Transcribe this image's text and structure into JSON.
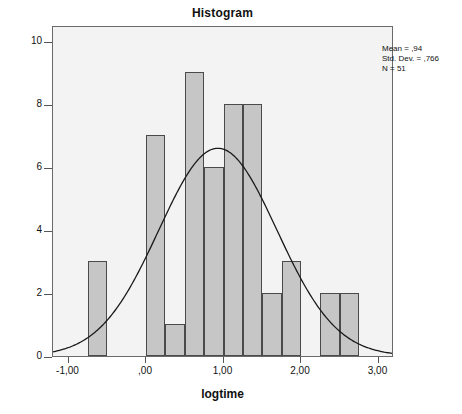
{
  "chart_data": {
    "type": "bar",
    "title": "Histogram",
    "xlabel": "logtime",
    "ylabel": "Frequency",
    "xlim": [
      -1.2,
      3.2
    ],
    "ylim": [
      0,
      10.5
    ],
    "grid": false,
    "legend_position": "none",
    "bin_width": 0.25,
    "x_tick_labels": [
      "-1,00",
      ",00",
      "1,00",
      "2,00",
      "3,00"
    ],
    "x_tick_values": [
      -1.0,
      0.0,
      1.0,
      2.0,
      3.0
    ],
    "y_tick_labels": [
      "0",
      "2",
      "4",
      "6",
      "8",
      "10"
    ],
    "y_tick_values": [
      0,
      2,
      4,
      6,
      8,
      10
    ],
    "bins": [
      {
        "start": -0.75,
        "end": -0.5,
        "value": 3
      },
      {
        "start": 0.0,
        "end": 0.25,
        "value": 7
      },
      {
        "start": 0.25,
        "end": 0.5,
        "value": 1
      },
      {
        "start": 0.5,
        "end": 0.75,
        "value": 9
      },
      {
        "start": 0.75,
        "end": 1.0,
        "value": 6
      },
      {
        "start": 1.0,
        "end": 1.25,
        "value": 8
      },
      {
        "start": 1.25,
        "end": 1.5,
        "value": 8
      },
      {
        "start": 1.5,
        "end": 1.75,
        "value": 2
      },
      {
        "start": 1.75,
        "end": 2.0,
        "value": 3
      },
      {
        "start": 2.25,
        "end": 2.5,
        "value": 2
      },
      {
        "start": 2.5,
        "end": 2.75,
        "value": 2
      }
    ],
    "categories": [
      "-0,75",
      "0,00",
      "0,25",
      "0,50",
      "0,75",
      "1,00",
      "1,25",
      "1,50",
      "1,75",
      "2,25",
      "2,50"
    ],
    "values": [
      3,
      7,
      1,
      9,
      6,
      8,
      8,
      2,
      3,
      2,
      2
    ],
    "normal_curve": {
      "label": "Normal distribution overlay",
      "mean": 0.94,
      "std_dev": 0.766,
      "n": 51,
      "peak_height": 6.63
    },
    "annotations": {
      "mean": "Mean = ,94",
      "std_dev": "Std. Dev. = ,766",
      "n": "N = 51"
    },
    "colors": {
      "bar_fill": "#c6c6c6",
      "bar_border": "#4a4a4a",
      "plot_background": "#f3f3f3",
      "frame": "#6a6a6a",
      "curve": "#1a1a1a",
      "text": "#111111"
    }
  }
}
